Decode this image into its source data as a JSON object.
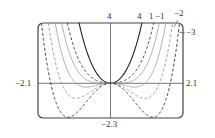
{
  "chart_data": {
    "type": "line",
    "title": "",
    "xlabel": "",
    "ylabel": "",
    "xlim": [
      -2.1,
      2.1
    ],
    "ylim": [
      -2.3,
      4
    ],
    "grid": false,
    "axis_labels": {
      "x_min": "−2.1",
      "x_max": "2.1",
      "y_min": "−2.3",
      "y_max": "4"
    },
    "function": "f(x) = x^4 + c x^2",
    "series": [
      {
        "name": "4",
        "c": 4,
        "style": "solid-black"
      },
      {
        "name": "1",
        "c": 1,
        "style": "dashed-black"
      },
      {
        "name": "0",
        "c": 0,
        "style": "solid-gray"
      },
      {
        "name": "−1",
        "c": -1,
        "style": "solid-gray"
      },
      {
        "name": "−2",
        "c": -2,
        "style": "dashed-gray"
      },
      {
        "name": "−3",
        "c": -3,
        "style": "dashed-black"
      }
    ],
    "curve_labels": [
      "4",
      "1",
      "−1",
      "−2",
      "−3"
    ]
  }
}
